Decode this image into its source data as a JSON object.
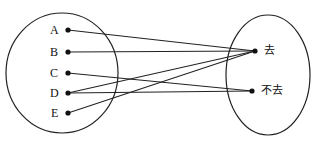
{
  "diagram": {
    "left_set": [
      "A",
      "B",
      "C",
      "D",
      "E"
    ],
    "right_set": [
      "去",
      "不去"
    ],
    "mappings": [
      {
        "from": "A",
        "to": "去"
      },
      {
        "from": "B",
        "to": "去"
      },
      {
        "from": "C",
        "to": "不去"
      },
      {
        "from": "D",
        "to": "去"
      },
      {
        "from": "D",
        "to": "不去"
      },
      {
        "from": "E",
        "to": "去"
      }
    ]
  }
}
